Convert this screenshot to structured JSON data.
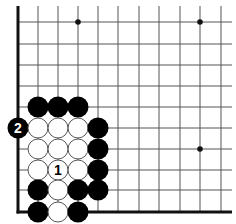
{
  "diagram": {
    "type": "go-board-fragment",
    "visible_columns": 11,
    "visible_rows": 10,
    "edges": [
      "left",
      "bottom"
    ],
    "colors": {
      "background": "#ffffff",
      "grid_line": "#555555",
      "edge_line": "#111111",
      "black_stone": "#000000",
      "white_stone": "#ffffff",
      "white_stone_outline": "#555555"
    },
    "star_points": [
      {
        "col": 3,
        "row": 0
      },
      {
        "col": 9,
        "row": 0
      },
      {
        "col": 9,
        "row": 6
      }
    ],
    "stones": [
      {
        "col": 1,
        "row": 4,
        "color": "black",
        "label": ""
      },
      {
        "col": 2,
        "row": 4,
        "color": "black",
        "label": ""
      },
      {
        "col": 3,
        "row": 4,
        "color": "black",
        "label": ""
      },
      {
        "col": 0,
        "row": 5,
        "color": "black",
        "label": "2"
      },
      {
        "col": 1,
        "row": 5,
        "color": "white",
        "label": ""
      },
      {
        "col": 2,
        "row": 5,
        "color": "white",
        "label": ""
      },
      {
        "col": 3,
        "row": 5,
        "color": "white",
        "label": ""
      },
      {
        "col": 4,
        "row": 5,
        "color": "black",
        "label": ""
      },
      {
        "col": 1,
        "row": 6,
        "color": "white",
        "label": ""
      },
      {
        "col": 2,
        "row": 6,
        "color": "white",
        "label": ""
      },
      {
        "col": 3,
        "row": 6,
        "color": "white",
        "label": ""
      },
      {
        "col": 4,
        "row": 6,
        "color": "black",
        "label": ""
      },
      {
        "col": 1,
        "row": 7,
        "color": "white",
        "label": ""
      },
      {
        "col": 2,
        "row": 7,
        "color": "white",
        "label": "1"
      },
      {
        "col": 3,
        "row": 7,
        "color": "white",
        "label": ""
      },
      {
        "col": 4,
        "row": 7,
        "color": "black",
        "label": ""
      },
      {
        "col": 1,
        "row": 8,
        "color": "black",
        "label": ""
      },
      {
        "col": 2,
        "row": 8,
        "color": "white",
        "label": ""
      },
      {
        "col": 3,
        "row": 8,
        "color": "black",
        "label": ""
      },
      {
        "col": 4,
        "row": 8,
        "color": "black",
        "label": ""
      },
      {
        "col": 1,
        "row": 9,
        "color": "black",
        "label": ""
      },
      {
        "col": 2,
        "row": 9,
        "color": "white",
        "label": ""
      },
      {
        "col": 3,
        "row": 9,
        "color": "black",
        "label": ""
      }
    ]
  }
}
